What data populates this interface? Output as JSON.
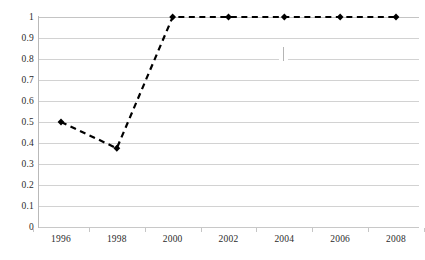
{
  "chart_data": {
    "type": "line",
    "title": "",
    "subtitle": "",
    "xlabel": "",
    "ylabel": "",
    "categories": [
      "1996",
      "1997",
      "1998",
      "1999",
      "2000",
      "2001",
      "2002",
      "2003",
      "2004",
      "2005",
      "2006",
      "2007",
      "2008"
    ],
    "x_tick_labels": [
      "1996",
      "1998",
      "2000",
      "2002",
      "2004",
      "2006",
      "2008"
    ],
    "x_tick_values": [
      1996,
      1998,
      2000,
      2002,
      2004,
      2006,
      2008
    ],
    "series": [
      {
        "name": "series-1",
        "x": [
          1996,
          1998,
          2000,
          2002,
          2004,
          2006,
          2008
        ],
        "values": [
          0.5,
          0.375,
          1,
          1,
          1,
          1,
          1
        ],
        "line_style": "dashed",
        "line_color": "#000000",
        "marker": "diamond",
        "marker_color": "#000000"
      }
    ],
    "y_tick_labels": [
      "1",
      "0.9",
      "0.8",
      "0.7",
      "0.6",
      "0.5",
      "0.4",
      "0.3",
      "0.2",
      "0.1",
      "0"
    ],
    "y_tick_values": [
      1,
      0.9,
      0.8,
      0.7,
      0.6,
      0.5,
      0.4,
      0.3,
      0.2,
      0.1,
      0
    ],
    "ylim": [
      0,
      1
    ],
    "grid": "horizontal",
    "legend": "none",
    "gridline_color": "#d2d2d2",
    "axis_color": "#b9b9b9",
    "text_color": "#2b2b2b",
    "background_color": "#ffffff"
  }
}
